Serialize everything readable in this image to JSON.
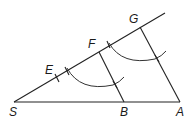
{
  "diagram": {
    "type": "geometric-construction",
    "points": {
      "S": {
        "label": "S",
        "x": 14,
        "y": 102
      },
      "B": {
        "label": "B",
        "x": 124,
        "y": 102
      },
      "A": {
        "label": "A",
        "x": 180,
        "y": 102
      },
      "E": {
        "label": "E",
        "x": 57,
        "y": 78
      },
      "F": {
        "label": "F",
        "x": 99,
        "y": 52
      },
      "G": {
        "label": "G",
        "x": 140,
        "y": 27
      }
    },
    "labels": {
      "S": "S",
      "B": "B",
      "A": "A",
      "E": "E",
      "F": "F",
      "G": "G"
    },
    "segments": [
      {
        "from": "S",
        "to": "A",
        "name": "base"
      },
      {
        "from": "S",
        "to": "ray-end",
        "name": "ray"
      },
      {
        "from": "F",
        "to": "B",
        "name": "parallel-FB"
      },
      {
        "from": "G",
        "to": "A",
        "name": "parallel-GA"
      }
    ],
    "arcs": [
      {
        "name": "arc-lower",
        "intersects": "FB"
      },
      {
        "name": "arc-upper",
        "intersects": "GA"
      }
    ],
    "stroke_color": "#222222"
  }
}
